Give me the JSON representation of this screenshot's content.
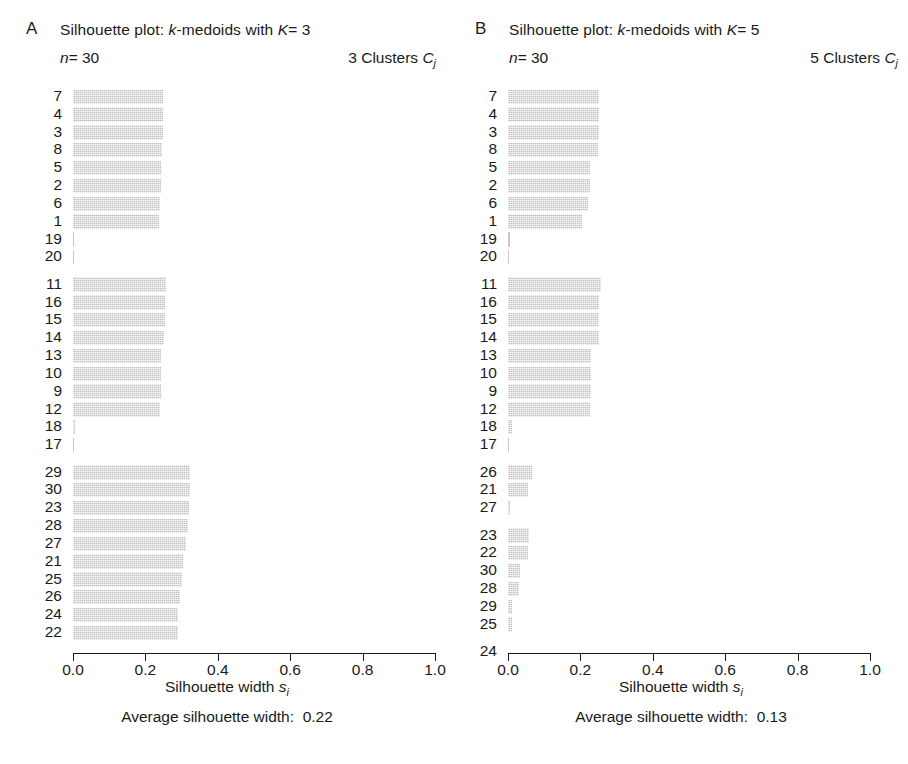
{
  "figure": {
    "width": 908,
    "height": 764,
    "bar_fill_color": "#dddddd",
    "axis_color": "#1a1a1a"
  },
  "panels": [
    {
      "letter": "A",
      "title_prefix": "Silhouette plot: ",
      "title_k_italic": "k",
      "title_mid": "-medoids with ",
      "title_K_italic": "K",
      "title_eq": "= 3",
      "n_label_italic": "n",
      "n_label_value": "= 30",
      "clusters_label": "3 Clusters ",
      "clusters_label_italic": "C",
      "clusters_label_sub": "j",
      "axis_title_prefix": "Silhouette width ",
      "axis_title_italic": "s",
      "axis_title_sub": "i",
      "average_label": "Average silhouette width:",
      "average_value": "0.22",
      "tick_labels": [
        "0.0",
        "0.2",
        "0.4",
        "0.6",
        "0.8",
        "1.0"
      ],
      "tick_values": [
        0.0,
        0.2,
        0.4,
        0.6,
        0.8,
        1.0
      ]
    },
    {
      "letter": "B",
      "title_prefix": "Silhouette plot: ",
      "title_k_italic": "k",
      "title_mid": "-medoids with ",
      "title_K_italic": "K",
      "title_eq": "= 5",
      "n_label_italic": "n",
      "n_label_value": "= 30",
      "clusters_label": "5 Clusters ",
      "clusters_label_italic": "C",
      "clusters_label_sub": "j",
      "axis_title_prefix": "Silhouette width ",
      "axis_title_italic": "s",
      "axis_title_sub": "i",
      "average_label": "Average silhouette width:",
      "average_value": "0.13",
      "tick_labels": [
        "0.0",
        "0.2",
        "0.4",
        "0.6",
        "0.8",
        "1.0"
      ],
      "tick_values": [
        0.0,
        0.2,
        0.4,
        0.6,
        0.8,
        1.0
      ]
    }
  ],
  "chart_data": [
    {
      "type": "bar",
      "orientation": "horizontal",
      "title": "Silhouette plot: k-medoids with K=3",
      "subtitle": "n=30",
      "right_annotation": "3 Clusters Cj",
      "xlabel": "Silhouette width s_i",
      "ylabel": "",
      "xlim": [
        0.0,
        1.0
      ],
      "grid": false,
      "legend": "none",
      "average_silhouette_width": 0.22,
      "n": 30,
      "k": 3,
      "clusters": [
        {
          "cluster": 1,
          "size": 10,
          "labels": [
            "7",
            "4",
            "3",
            "8",
            "5",
            "2",
            "6",
            "1",
            "19",
            "20"
          ],
          "values": [
            0.248,
            0.248,
            0.248,
            0.247,
            0.243,
            0.243,
            0.24,
            0.237,
            0.004,
            0.002
          ]
        },
        {
          "cluster": 2,
          "size": 10,
          "labels": [
            "11",
            "16",
            "15",
            "14",
            "13",
            "10",
            "9",
            "12",
            "18",
            "17"
          ],
          "values": [
            0.256,
            0.253,
            0.253,
            0.252,
            0.243,
            0.243,
            0.243,
            0.24,
            0.006,
            0.003
          ]
        },
        {
          "cluster": 3,
          "size": 10,
          "labels": [
            "29",
            "30",
            "23",
            "28",
            "27",
            "21",
            "25",
            "26",
            "24",
            "22"
          ],
          "values": [
            0.323,
            0.322,
            0.32,
            0.318,
            0.312,
            0.303,
            0.3,
            0.296,
            0.291,
            0.29
          ]
        }
      ]
    },
    {
      "type": "bar",
      "orientation": "horizontal",
      "title": "Silhouette plot: k-medoids with K=5",
      "subtitle": "n=30",
      "right_annotation": "5 Clusters Cj",
      "xlabel": "Silhouette width s_i",
      "ylabel": "",
      "xlim": [
        0.0,
        1.0
      ],
      "grid": false,
      "legend": "none",
      "average_silhouette_width": 0.13,
      "n": 30,
      "k": 5,
      "clusters": [
        {
          "cluster": 1,
          "size": 10,
          "labels": [
            "7",
            "4",
            "3",
            "8",
            "5",
            "2",
            "6",
            "1",
            "19",
            "20"
          ],
          "values": [
            0.25,
            0.25,
            0.25,
            0.248,
            0.226,
            0.226,
            0.221,
            0.205,
            0.005,
            0.003
          ]
        },
        {
          "cluster": 2,
          "size": 10,
          "labels": [
            "11",
            "16",
            "15",
            "14",
            "13",
            "10",
            "9",
            "12",
            "18",
            "17"
          ],
          "values": [
            0.258,
            0.252,
            0.252,
            0.25,
            0.23,
            0.23,
            0.23,
            0.227,
            0.01,
            0.004
          ]
        },
        {
          "cluster": 3,
          "size": 3,
          "labels": [
            "26",
            "21",
            "27"
          ],
          "values": [
            0.066,
            0.055,
            0.006
          ]
        },
        {
          "cluster": 4,
          "size": 6,
          "labels": [
            "23",
            "22",
            "30",
            "28",
            "29",
            "25"
          ],
          "values": [
            0.058,
            0.056,
            0.034,
            0.03,
            0.012,
            0.011
          ]
        },
        {
          "cluster": 5,
          "size": 1,
          "labels": [
            "24"
          ],
          "values": [
            0.0
          ]
        }
      ]
    }
  ]
}
